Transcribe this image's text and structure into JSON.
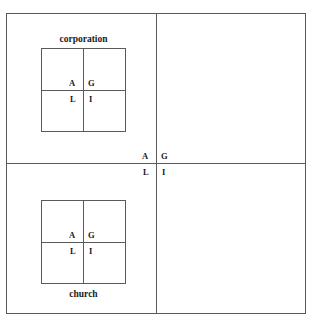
{
  "figure": {
    "type": "agil-interpenetration-diagram",
    "outer_system": {
      "name": "outer-agil-grid",
      "quadrant_labels": {
        "a": "A",
        "g": "G",
        "l": "L",
        "i": "I"
      }
    },
    "subsystems": [
      {
        "caption": "corporation",
        "caption_position": "above",
        "parent_quadrant": "A",
        "quadrant_labels": {
          "a": "A",
          "g": "G",
          "l": "L",
          "i": "I"
        }
      },
      {
        "caption": "church",
        "caption_position": "below",
        "parent_quadrant": "L",
        "quadrant_labels": {
          "a": "A",
          "g": "G",
          "l": "L",
          "i": "I"
        }
      }
    ],
    "colors": {
      "line": "#5a5a5a",
      "text": "#1a1a1a",
      "background": "#ffffff"
    }
  }
}
